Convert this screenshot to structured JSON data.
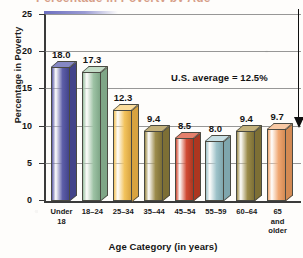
{
  "figure": {
    "clipped_title_fragment": "Percentage in Poverty by Age",
    "annotation": "U.S. average = 12.5%",
    "callout": {
      "name": "down-arrow-to-60-64-bar",
      "points_at_category": "60–64",
      "points_at_value": 9.4
    }
  },
  "chart_data": {
    "type": "bar",
    "title": "",
    "xlabel": "Age Category (in years)",
    "ylabel": "Percentage in Poverty",
    "ylim": [
      0,
      25
    ],
    "yticks": [
      0,
      5,
      10,
      15,
      20,
      25
    ],
    "ytick_labels": [
      "0",
      "5",
      "10",
      "15",
      "20",
      "25"
    ],
    "grid": true,
    "legend": "none",
    "categories": [
      "Under\n18",
      "18–24",
      "25–34",
      "35–44",
      "45–54",
      "55–59",
      "60–64",
      "65\nand\nolder"
    ],
    "values": [
      18.0,
      17.3,
      12.3,
      9.4,
      8.5,
      8.0,
      9.4,
      9.7
    ],
    "data_labels": [
      "18.0",
      "17.3",
      "12.3",
      "9.4",
      "8.5",
      "8.0",
      "9.4",
      "9.7"
    ],
    "bar_colors": [
      "#5d5ea8",
      "#9dc2a4",
      "#f2c35d",
      "#9b8b4a",
      "#d04a33",
      "#9dc2c9",
      "#9b8b4a",
      "#f0a772"
    ],
    "bar_side_colors": [
      "#42438a",
      "#7fa687",
      "#d8a33f",
      "#7d6f35",
      "#ad3620",
      "#7fa6ad",
      "#7d6f35",
      "#d38a53"
    ],
    "bar_top_colors": [
      "#8688c4",
      "#c3dcc7",
      "#fbdd9c",
      "#c2b07a",
      "#e5806c",
      "#c6dee3",
      "#c2b07a",
      "#f8c9a5"
    ],
    "annotations": [
      {
        "text": "U.S. average = 12.5%",
        "x_category": "25–34",
        "y": 17.0
      }
    ]
  }
}
